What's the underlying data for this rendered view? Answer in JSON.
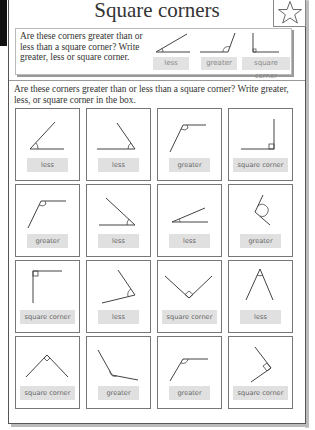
{
  "worksheet": {
    "title": "Square corners",
    "star_icon": "star-outline-icon",
    "example": {
      "text": "Are these corners greater than or less than a square corner? Write greater, less or square corner.",
      "items": [
        {
          "angle": "acute",
          "label": "less"
        },
        {
          "angle": "obtuse",
          "label": "greater"
        },
        {
          "angle": "right",
          "label": "square corner"
        }
      ]
    },
    "instructions": "Are these corners greater than or less than a square corner? Write greater, less, or square corner in the box.",
    "grid": {
      "rows": 4,
      "columns": 4,
      "cells": [
        {
          "angle": "acute",
          "answer": "less"
        },
        {
          "angle": "acute",
          "answer": "less"
        },
        {
          "angle": "obtuse",
          "answer": "greater"
        },
        {
          "angle": "right",
          "answer": "square corner"
        },
        {
          "angle": "obtuse",
          "answer": "greater"
        },
        {
          "angle": "acute",
          "answer": "less"
        },
        {
          "angle": "acute",
          "answer": "less"
        },
        {
          "angle": "obtuse",
          "answer": "greater"
        },
        {
          "angle": "right",
          "answer": "square corner"
        },
        {
          "angle": "acute",
          "answer": "less"
        },
        {
          "angle": "right",
          "answer": "square corner"
        },
        {
          "angle": "acute",
          "answer": "less"
        },
        {
          "angle": "right",
          "answer": "square corner"
        },
        {
          "angle": "obtuse",
          "answer": "greater"
        },
        {
          "angle": "obtuse",
          "answer": "greater"
        },
        {
          "angle": "right",
          "answer": "square corner"
        }
      ]
    }
  }
}
